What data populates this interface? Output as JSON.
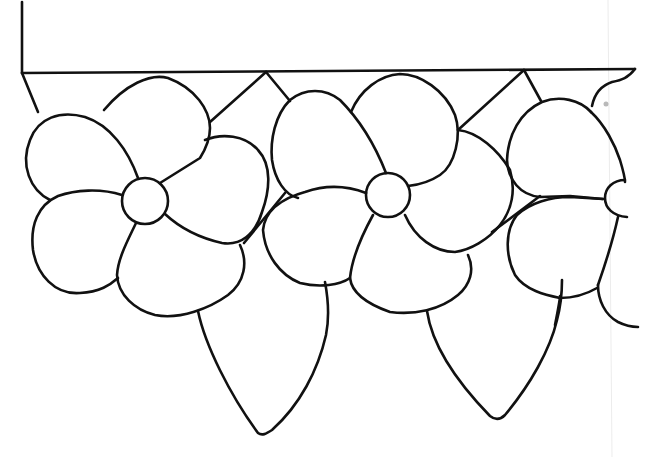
{
  "drawing": {
    "title": "Flower border line-art pattern",
    "style": "black outline on white, stained-glass pattern",
    "colors": {
      "line": "#111111",
      "background": "#ffffff"
    },
    "elements": {
      "frame": "top border panel with left vertical edge",
      "flowers": [
        {
          "name": "flower-1",
          "petals": 5,
          "center": [
            145,
            200
          ]
        },
        {
          "name": "flower-2",
          "petals": 5,
          "center": [
            388,
            195
          ]
        },
        {
          "name": "flower-3",
          "petals": "partial",
          "center": [
            620,
            197
          ]
        }
      ],
      "leaves": [
        {
          "name": "leaf-1",
          "tip": [
            262,
            433
          ]
        },
        {
          "name": "leaf-2",
          "tip": [
            497,
            418
          ]
        }
      ]
    }
  }
}
